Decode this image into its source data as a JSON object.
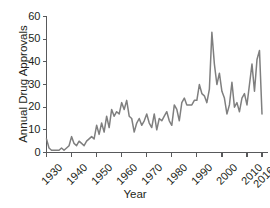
{
  "chart_data": {
    "type": "line",
    "title": "",
    "xlabel": "Year",
    "ylabel": "Annual Drug Approvals",
    "xlim": [
      1930,
      2016
    ],
    "ylim": [
      0,
      60
    ],
    "grid": false,
    "legend": null,
    "line_color": "#7f7f7f",
    "axis_color": "#58595b",
    "xticks": [
      1930,
      1940,
      1950,
      1960,
      1970,
      1980,
      1990,
      2000,
      2010,
      2016
    ],
    "xtick_labels": [
      "1930",
      "1940",
      "1950",
      "1960",
      "1970",
      "1980",
      "1990",
      "2000",
      "2010",
      "2016*"
    ],
    "yticks": [
      0,
      10,
      20,
      30,
      40,
      50,
      60
    ],
    "ytick_labels": [
      "0",
      "10",
      "20",
      "30",
      "40",
      "50",
      "60"
    ],
    "note": "2016 value is partial-year, marked with asterisk",
    "x": [
      1930,
      1931,
      1932,
      1933,
      1934,
      1935,
      1936,
      1937,
      1938,
      1939,
      1940,
      1941,
      1942,
      1943,
      1944,
      1945,
      1946,
      1947,
      1948,
      1949,
      1950,
      1951,
      1952,
      1953,
      1954,
      1955,
      1956,
      1957,
      1958,
      1959,
      1960,
      1961,
      1962,
      1963,
      1964,
      1965,
      1966,
      1967,
      1968,
      1969,
      1970,
      1971,
      1972,
      1973,
      1974,
      1975,
      1976,
      1977,
      1978,
      1979,
      1980,
      1981,
      1982,
      1983,
      1984,
      1985,
      1986,
      1987,
      1988,
      1989,
      1990,
      1991,
      1992,
      1993,
      1994,
      1995,
      1996,
      1997,
      1998,
      1999,
      2000,
      2001,
      2002,
      2003,
      2004,
      2005,
      2006,
      2007,
      2008,
      2009,
      2010,
      2011,
      2012,
      2013,
      2014,
      2015,
      2016
    ],
    "values": [
      6,
      2,
      1,
      1,
      1,
      1,
      2,
      1,
      2,
      3,
      7,
      4,
      3,
      5,
      4,
      3,
      5,
      6,
      7,
      6,
      12,
      8,
      13,
      9,
      16,
      11,
      19,
      16,
      18,
      17,
      22,
      19,
      23,
      16,
      15,
      9,
      13,
      15,
      12,
      14,
      17,
      13,
      11,
      17,
      10,
      15,
      14,
      16,
      18,
      14,
      12,
      21,
      19,
      14,
      22,
      24,
      21,
      21,
      21,
      23,
      23,
      30,
      26,
      25,
      22,
      28,
      53,
      39,
      30,
      35,
      27,
      24,
      17,
      21,
      31,
      20,
      22,
      18,
      24,
      26,
      21,
      30,
      39,
      27,
      41,
      45,
      17
    ]
  }
}
